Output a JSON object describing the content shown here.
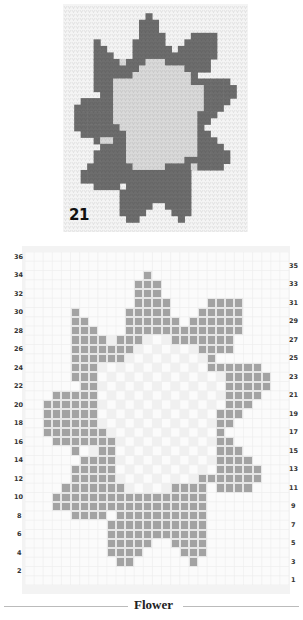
{
  "photo": {
    "label": "21",
    "colors": {
      "background": "#f4f4f4",
      "petals": "#6d6d6d",
      "center": "#d9d9d9"
    }
  },
  "chart": {
    "rows": 36,
    "cols": 29,
    "fill_color": "#a3a3a3",
    "light_color": "#f0f0f0",
    "left_labels": [
      "36",
      "34",
      "32",
      "30",
      "28",
      "26",
      "24",
      "22",
      "20",
      "18",
      "16",
      "14",
      "12",
      "10",
      "8",
      "6",
      "4",
      "2"
    ],
    "right_labels": [
      "35",
      "33",
      "31",
      "29",
      "27",
      "25",
      "23",
      "21",
      "19",
      "17",
      "15",
      "13",
      "11",
      "9",
      "7",
      "5",
      "3",
      "1"
    ],
    "filled": {
      "34": [
        [
          13,
          13
        ]
      ],
      "33": [
        [
          12,
          14
        ]
      ],
      "32": [
        [
          12,
          14
        ]
      ],
      "31": [
        [
          12,
          15
        ],
        [
          20,
          23
        ]
      ],
      "30": [
        [
          5,
          5
        ],
        [
          11,
          15
        ],
        [
          19,
          23
        ]
      ],
      "29": [
        [
          5,
          6
        ],
        [
          11,
          16
        ],
        [
          18,
          23
        ]
      ],
      "28": [
        [
          5,
          7
        ],
        [
          11,
          23
        ]
      ],
      "27": [
        [
          5,
          8
        ],
        [
          10,
          12
        ],
        [
          16,
          22
        ]
      ],
      "26": [
        [
          5,
          11
        ],
        [
          19,
          22
        ]
      ],
      "25": [
        [
          5,
          10
        ],
        [
          20,
          20
        ]
      ],
      "24": [
        [
          5,
          7
        ],
        [
          20,
          25
        ]
      ],
      "23": [
        [
          5,
          7
        ],
        [
          22,
          26
        ]
      ],
      "22": [
        [
          6,
          7
        ],
        [
          22,
          26
        ]
      ],
      "21": [
        [
          3,
          7
        ],
        [
          22,
          25
        ]
      ],
      "20": [
        [
          2,
          7
        ],
        [
          22,
          24
        ]
      ],
      "19": [
        [
          2,
          7
        ],
        [
          21,
          23
        ]
      ],
      "18": [
        [
          2,
          7
        ],
        [
          21,
          22
        ]
      ],
      "17": [
        [
          2,
          8
        ],
        [
          21,
          21
        ]
      ],
      "16": [
        [
          3,
          9
        ],
        [
          21,
          22
        ]
      ],
      "15": [
        [
          5,
          5
        ],
        [
          8,
          9
        ],
        [
          21,
          23
        ]
      ],
      "14": [
        [
          6,
          9
        ],
        [
          21,
          24
        ]
      ],
      "13": [
        [
          5,
          9
        ],
        [
          21,
          25
        ]
      ],
      "12": [
        [
          5,
          9
        ],
        [
          19,
          25
        ]
      ],
      "11": [
        [
          4,
          10
        ],
        [
          16,
          19
        ],
        [
          21,
          24
        ]
      ],
      "10": [
        [
          3,
          19
        ]
      ],
      "9": [
        [
          3,
          19
        ]
      ],
      "8": [
        [
          5,
          8
        ],
        [
          10,
          19
        ]
      ],
      "7": [
        [
          9,
          19
        ]
      ],
      "6": [
        [
          9,
          19
        ]
      ],
      "5": [
        [
          9,
          13
        ],
        [
          16,
          19
        ]
      ],
      "4": [
        [
          9,
          12
        ],
        [
          17,
          19
        ]
      ],
      "3": [
        [
          10,
          11
        ],
        [
          18,
          18
        ]
      ]
    }
  },
  "caption": "Flower"
}
